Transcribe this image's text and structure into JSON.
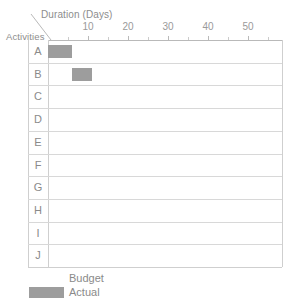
{
  "chart_data": {
    "type": "bar",
    "title": "",
    "xlabel": "Duration (Days)",
    "ylabel": "Activities",
    "orientation": "horizontal",
    "grid": true,
    "xlim": [
      0,
      58
    ],
    "xticks": [
      10,
      20,
      30,
      40,
      50
    ],
    "xtick_labels": [
      "10",
      "20",
      "30",
      "40",
      "50"
    ],
    "minor_xticks": [
      5,
      15,
      25,
      35,
      45,
      55
    ],
    "categories": [
      "A",
      "B",
      "C",
      "D",
      "E",
      "F",
      "G",
      "H",
      "I",
      "J"
    ],
    "legend": {
      "position": "bottom-left",
      "entries": [
        {
          "name": "Budget",
          "color": "#ffffff"
        },
        {
          "name": "Actual",
          "color": "#9d9d9d"
        }
      ]
    },
    "series": [
      {
        "name": "Actual",
        "color": "#9d9d9d",
        "bars": [
          {
            "activity": "A",
            "start": 0,
            "duration": 6,
            "end": 6
          },
          {
            "activity": "B",
            "start": 6,
            "duration": 5,
            "end": 11
          }
        ]
      },
      {
        "name": "Budget",
        "color": "#ffffff",
        "bars": []
      }
    ],
    "values": [
      6,
      5,
      0,
      0,
      0,
      0,
      0,
      0,
      0,
      0
    ]
  },
  "axis": {
    "x_title": "Duration (Days)",
    "y_title": "Activities",
    "tick_labels": [
      "10",
      "20",
      "30",
      "40",
      "50"
    ]
  },
  "rows": [
    {
      "label": "A"
    },
    {
      "label": "B"
    },
    {
      "label": "C"
    },
    {
      "label": "D"
    },
    {
      "label": "E"
    },
    {
      "label": "F"
    },
    {
      "label": "G"
    },
    {
      "label": "H"
    },
    {
      "label": "I"
    },
    {
      "label": "J"
    }
  ],
  "legend": {
    "budget_label": "Budget",
    "actual_label": "Actual"
  },
  "colors": {
    "bar_fill": "#9d9d9d",
    "grid_line": "#d8d8d8",
    "border_line": "#cfcfcf",
    "axis_line": "#b9b9b9",
    "text": "#8a8a8a",
    "background": "#ffffff"
  }
}
